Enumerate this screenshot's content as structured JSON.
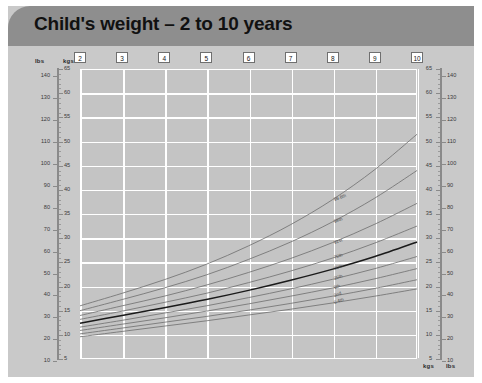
{
  "header": {
    "title": "Child's weight – 2 to 10 years"
  },
  "axes": {
    "left_unit_outer": "lbs",
    "left_unit_inner": "kgs",
    "right_unit_inner": "kgs",
    "right_unit_outer": "lbs",
    "bottom_unit_inner": "kgs",
    "bottom_unit_outer": "lbs",
    "kg_ticks": [
      5,
      10,
      15,
      20,
      25,
      30,
      35,
      40,
      45,
      50,
      55,
      60,
      65
    ],
    "lbs_ticks": [
      10,
      20,
      30,
      40,
      50,
      60,
      70,
      80,
      90,
      100,
      110,
      120,
      130,
      140
    ],
    "age_ticks": [
      2,
      3,
      4,
      5,
      6,
      7,
      8,
      9,
      10
    ]
  },
  "chart_data": {
    "type": "line",
    "title": "Child's weight – 2 to 10 years",
    "xlabel": "Age (years)",
    "ylabel": "Weight",
    "xlim": [
      2,
      10
    ],
    "ylim": [
      5,
      65
    ],
    "y_unit_primary": "kgs",
    "y_unit_secondary": "lbs",
    "grid": true,
    "legend": "inline-curve-labels",
    "x": [
      2,
      3,
      4,
      5,
      6,
      7,
      8,
      9,
      10
    ],
    "series": [
      {
        "name": "99.6th",
        "label": "99.6th",
        "emphasis": false,
        "values": [
          16.0,
          18.6,
          21.4,
          24.6,
          28.4,
          32.8,
          38.0,
          44.2,
          51.5
        ]
      },
      {
        "name": "98th",
        "label": "98th",
        "emphasis": false,
        "values": [
          15.0,
          17.3,
          19.7,
          22.4,
          25.6,
          29.2,
          33.4,
          38.3,
          44.0
        ]
      },
      {
        "name": "91st",
        "label": "91st",
        "emphasis": false,
        "values": [
          14.0,
          16.0,
          18.0,
          20.3,
          22.9,
          25.8,
          29.1,
          32.9,
          37.2
        ]
      },
      {
        "name": "75th",
        "label": "75th",
        "emphasis": false,
        "values": [
          13.2,
          14.9,
          16.7,
          18.6,
          20.8,
          23.2,
          25.9,
          29.0,
          32.5
        ]
      },
      {
        "name": "50th",
        "label": "50th",
        "emphasis": true,
        "values": [
          12.4,
          14.0,
          15.6,
          17.3,
          19.2,
          21.3,
          23.6,
          26.2,
          29.2
        ]
      },
      {
        "name": "25th",
        "label": "25th",
        "emphasis": false,
        "values": [
          11.6,
          13.0,
          14.5,
          16.0,
          17.7,
          19.5,
          21.5,
          23.7,
          26.2
        ]
      },
      {
        "name": "9th",
        "label": "9th",
        "emphasis": false,
        "values": [
          10.9,
          12.2,
          13.5,
          14.9,
          16.4,
          18.0,
          19.7,
          21.6,
          23.7
        ]
      },
      {
        "name": "2nd",
        "label": "2nd",
        "emphasis": false,
        "values": [
          10.2,
          11.4,
          12.6,
          13.8,
          15.1,
          16.5,
          18.0,
          19.6,
          21.4
        ]
      },
      {
        "name": "0.4th",
        "label": "0.4th",
        "emphasis": false,
        "values": [
          9.6,
          10.7,
          11.8,
          12.9,
          14.1,
          15.3,
          16.6,
          18.0,
          19.5
        ]
      }
    ]
  }
}
